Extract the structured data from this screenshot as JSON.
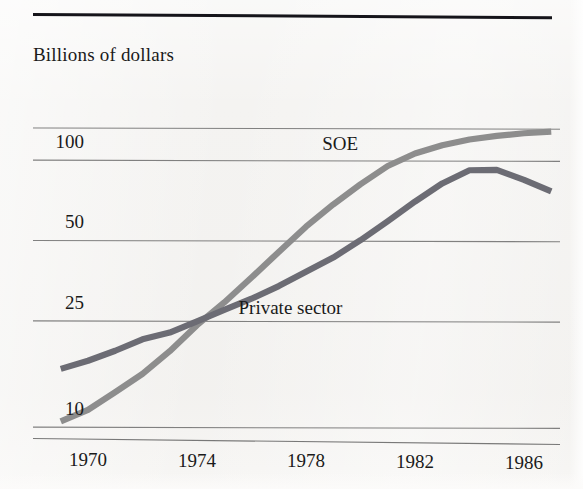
{
  "figure": {
    "title": "Billions of dollars",
    "rule_color": "#15141a",
    "background_color": "#f4f3f1"
  },
  "chart_data": {
    "type": "line",
    "title": "Billions of dollars",
    "xlabel": "",
    "ylabel": "Billions of dollars",
    "yscale": "log",
    "ylim": [
      10,
      140
    ],
    "xlim": [
      1969,
      1987
    ],
    "grid": true,
    "grid_color": "#5a5a5a",
    "legend": "inline-annotations",
    "x": [
      1969,
      1970,
      1971,
      1972,
      1973,
      1974,
      1975,
      1976,
      1977,
      1978,
      1979,
      1980,
      1981,
      1982,
      1983,
      1984,
      1985,
      1986,
      1987
    ],
    "xticks": [
      1970,
      1974,
      1978,
      1982,
      1986
    ],
    "yticks": [
      10,
      25,
      50,
      100
    ],
    "ytick_labels": [
      "10",
      "25",
      "50",
      "100"
    ],
    "series": [
      {
        "name": "SOE",
        "color": "#8d8d8d",
        "label_x": 1979.4,
        "label_y": 112,
        "values": [
          10.3,
          11.4,
          13.3,
          15.6,
          19.0,
          23.8,
          29.0,
          36.0,
          45.0,
          56.0,
          68.0,
          81.0,
          95.0,
          106.0,
          114.0,
          120.0,
          124.0,
          127.0,
          129.0
        ]
      },
      {
        "name": "Private sector",
        "color": "#6c6c74",
        "label_x": 1976.0,
        "label_y": 27,
        "values": [
          16.2,
          17.4,
          19.0,
          21.0,
          22.3,
          24.6,
          27.2,
          30.0,
          33.5,
          38.0,
          43.0,
          50.0,
          59.0,
          70.0,
          82.0,
          92.0,
          92.5,
          85.0,
          77.0
        ]
      }
    ],
    "annotations": [
      {
        "text": "SOE",
        "series": "SOE"
      },
      {
        "text": "Private sector",
        "series": "Private sector"
      }
    ]
  },
  "axes": {
    "y_labels": [
      "100",
      "50",
      "25",
      "10"
    ],
    "x_labels": [
      "1970",
      "1974",
      "1978",
      "1982",
      "1986"
    ]
  }
}
